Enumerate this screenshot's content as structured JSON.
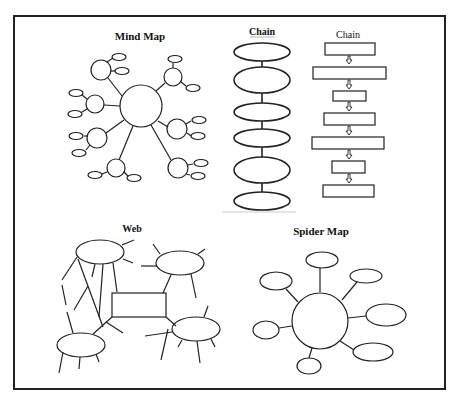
{
  "titles": {
    "mind_map": "Mind Map",
    "chain_ovals": "Chain",
    "chain_boxes": "Chain",
    "web": "Web",
    "spider_map": "Spider Map"
  },
  "colors": {
    "stroke": "#222222",
    "background": "#ffffff"
  }
}
